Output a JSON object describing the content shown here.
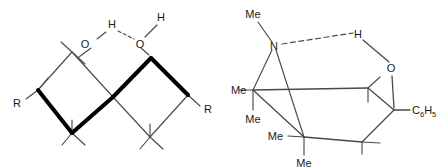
{
  "figure": {
    "background_color": "#ffffff",
    "ink_color": "#1a1a1a",
    "bold_bond_color": "#000000",
    "thin_bond_color": "#4a4a4a",
    "width": 444,
    "height": 168,
    "panel_count": 2
  },
  "left_structure": {
    "name": "hydrogen-bonded-dimer",
    "description": "Two fused four-membered rings sharing a central vertex with intermolecular O-H hydrogen bonding bridge across the top and R substituents at the outer vertices",
    "labels": {
      "o_left": "O",
      "h_left": "H",
      "o_right": "O",
      "h_right": "H",
      "r_left": "R",
      "r_right": "R"
    },
    "bonds": {
      "oh_left_type": "solid",
      "h_o_bridge_type": "dashed",
      "o_h_right_type": "dashed",
      "bold_bond_count": 4
    }
  },
  "right_structure": {
    "name": "aziridine-fused-ring-intramolecular-h-bond",
    "description": "N-methyl aziridine fused to a six-membered ring bearing two gem-dimethyl groups, an oxygen and a phenyl substituent, with a dashed intramolecular hydrogen bond from nitrogen to the hydroxyl hydrogen",
    "labels": {
      "n_methyl": "Me",
      "nitrogen": "N",
      "hydroxyl_h": "H",
      "oxygen": "O",
      "gem_methyl_1a": "Me",
      "gem_methyl_1b": "Me",
      "gem_methyl_2a": "Me",
      "gem_methyl_2b": "Me",
      "phenyl_main": "C",
      "phenyl_sub_1": "6",
      "phenyl_sub_2": "H",
      "phenyl_sub_3": "5"
    },
    "bonds": {
      "n_h_bond_type": "dashed",
      "h_o_bond_type": "solid",
      "o_c_bond_type": "solid"
    }
  }
}
